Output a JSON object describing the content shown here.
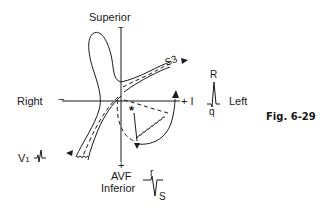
{
  "figure": {
    "label": "Fig. 6-29",
    "axes": {
      "superior": "Superior",
      "inferior": "Inferior",
      "right": "Right",
      "left": "Left",
      "right_sign": "−",
      "left_sign": "+ I",
      "superior_sign": "−",
      "inferior_sign": "+",
      "avf": "AVF"
    },
    "annotations": {
      "s3": "S3",
      "star": "*",
      "v1": "V",
      "v1_sub": "1"
    },
    "lead_I_complex": {
      "R": "R",
      "q": "q"
    },
    "lead_aVF_complex": {
      "r": "r",
      "S": "S"
    }
  },
  "colors": {
    "ink": "#1a1a1a",
    "background": "#ffffff"
  }
}
